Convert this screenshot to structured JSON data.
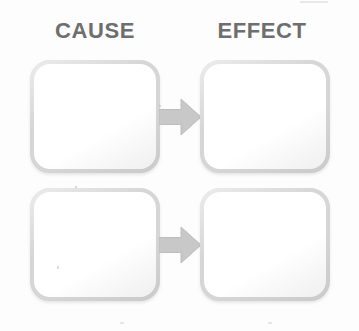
{
  "diagram": {
    "kind": "cause-and-effect-graphic-organizer",
    "columns": [
      {
        "id": "cause",
        "header": "CAUSE"
      },
      {
        "id": "effect",
        "header": "EFFECT"
      }
    ],
    "rows": [
      {
        "id": "row-1",
        "cause_text": "",
        "effect_text": "",
        "connector": {
          "icon": "arrow-right-icon",
          "direction": "right"
        }
      },
      {
        "id": "row-2",
        "cause_text": "",
        "effect_text": "",
        "connector": {
          "icon": "arrow-right-icon",
          "direction": "right"
        }
      }
    ],
    "colors": {
      "background": "#fdfdfd",
      "header_text": "#6e6e6e",
      "box_fill": "#ffffff",
      "box_border": "#d6d6d6",
      "arrow_fill": "#c8c8c8",
      "arrow_stroke": "#bdbdbd"
    }
  }
}
